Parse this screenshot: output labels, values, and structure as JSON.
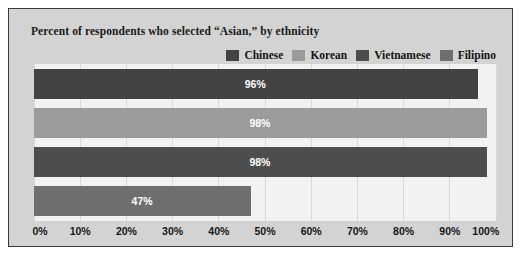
{
  "chart_data": {
    "type": "bar",
    "orientation": "horizontal",
    "title": "Percent of respondents who selected “Asian,” by ethnicity",
    "xlabel": "",
    "ylabel": "",
    "xlim": [
      0,
      100
    ],
    "grid": true,
    "legend_position": "top-right",
    "categories": [
      "Chinese",
      "Korean",
      "Vietnamese",
      "Filipino"
    ],
    "values": [
      96,
      98,
      98,
      47
    ],
    "value_labels": [
      "96%",
      "98%",
      "98%",
      "47%"
    ],
    "tick_labels": [
      "0%",
      "10%",
      "20%",
      "30%",
      "40%",
      "50%",
      "60%",
      "70%",
      "80%",
      "90%",
      "100%"
    ],
    "tick_values": [
      0,
      10,
      20,
      30,
      40,
      50,
      60,
      70,
      80,
      90,
      100
    ],
    "series": [
      {
        "name": "Chinese",
        "value": 96,
        "label": "96%",
        "color": "#434343"
      },
      {
        "name": "Korean",
        "value": 98,
        "label": "98%",
        "color": "#9b9b9b"
      },
      {
        "name": "Vietnamese",
        "value": 98,
        "label": "98%",
        "color": "#4d4d4d"
      },
      {
        "name": "Filipino",
        "value": 47,
        "label": "47%",
        "color": "#6e6e6e"
      }
    ]
  },
  "legend": {
    "items": [
      {
        "label": "Chinese",
        "color": "#434343"
      },
      {
        "label": "Korean",
        "color": "#9b9b9b"
      },
      {
        "label": "Vietnamese",
        "color": "#4d4d4d"
      },
      {
        "label": "Filipino",
        "color": "#6e6e6e"
      }
    ]
  },
  "colors": {
    "frame_background": "#d3d3d3",
    "frame_border": "#3a3a3a",
    "plot_background": "#f2f2f2",
    "gridline": "#d8d8d8",
    "title_text": "#1a1a1a",
    "axis_text": "#161616",
    "value_text": "#ffffff"
  }
}
